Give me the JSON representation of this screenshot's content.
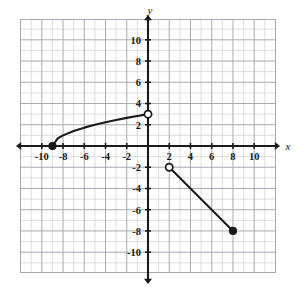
{
  "figure": {
    "background_color": "#ffffff",
    "ink_color": "#1a1a1a",
    "grid_minor_color": "#cfcfd6",
    "grid_major_color": "#a9a9b4"
  },
  "axes": {
    "x_label": "x",
    "y_label": "y",
    "x_ticks": [
      "-10",
      "-8",
      "-6",
      "-4",
      "-2",
      "2",
      "4",
      "6",
      "8",
      "10"
    ],
    "y_ticks": [
      "10",
      "8",
      "6",
      "4",
      "2",
      "-2",
      "-4",
      "-6",
      "-8",
      "-10"
    ],
    "x_range": [
      -12,
      12
    ],
    "y_range": [
      -12,
      12
    ],
    "tick_step": 2,
    "minor_grid_step": 1,
    "grid": true,
    "arrows": "both-ends-both-axes"
  },
  "chart_data": {
    "type": "line",
    "title": "",
    "xlabel": "x",
    "ylabel": "y",
    "xlim": [
      -12,
      12
    ],
    "ylim": [
      -12,
      12
    ],
    "grid": true,
    "legend": "none",
    "categories": [],
    "series": [
      {
        "name": "square-root branch",
        "type": "curve",
        "equation": "y = sqrt(x + 9)",
        "x": [
          -9,
          -8.5,
          -8,
          -7,
          -6,
          -5,
          -4,
          -3,
          -2,
          -1,
          0
        ],
        "values": [
          0,
          0.71,
          1,
          1.41,
          1.73,
          2,
          2.24,
          2.45,
          2.65,
          2.83,
          3
        ],
        "endpoints": [
          {
            "x": -9,
            "y": 0,
            "marker": "closed-circle"
          },
          {
            "x": 0,
            "y": 3,
            "marker": "open-circle"
          }
        ]
      },
      {
        "name": "linear segment",
        "type": "segment",
        "equation": "y = -x",
        "x": [
          2,
          8
        ],
        "values": [
          -2,
          -8
        ],
        "endpoints": [
          {
            "x": 2,
            "y": -2,
            "marker": "open-circle"
          },
          {
            "x": 8,
            "y": -8,
            "marker": "closed-circle"
          }
        ]
      }
    ],
    "annotations": []
  }
}
